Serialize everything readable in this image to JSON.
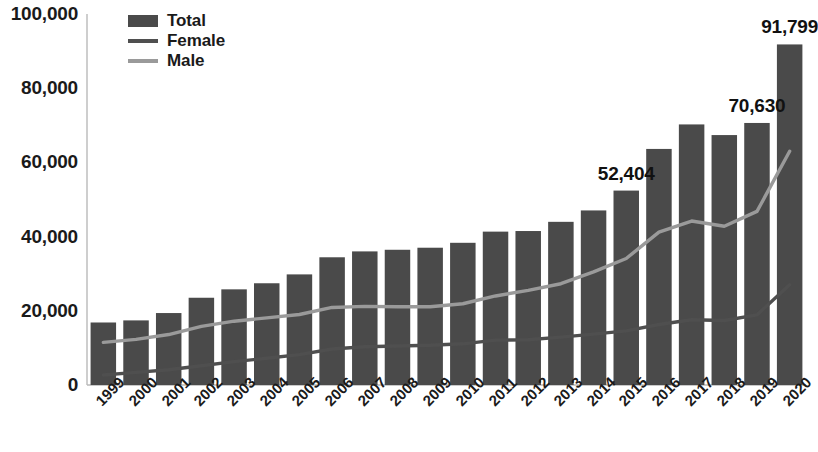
{
  "chart_data": {
    "type": "bar",
    "title": "",
    "subtitle": "",
    "xlabel": "",
    "ylabel": "",
    "ylim": [
      0,
      100000
    ],
    "yticks": [
      0,
      20000,
      40000,
      60000,
      80000,
      100000
    ],
    "ytick_labels": [
      "0",
      "20,000",
      "40,000",
      "60,000",
      "80,000",
      "100,000"
    ],
    "grid": false,
    "legend_position": "top-left",
    "categories": [
      "1999",
      "2000",
      "2001",
      "2002",
      "2003",
      "2004",
      "2005",
      "2006",
      "2007",
      "2008",
      "2009",
      "2010",
      "2011",
      "2012",
      "2013",
      "2014",
      "2015",
      "2016",
      "2017",
      "2018",
      "2019",
      "2020"
    ],
    "series": [
      {
        "name": "Total",
        "kind": "bar",
        "color": "#4a4a4a",
        "values": [
          16849,
          17415,
          19394,
          23518,
          25785,
          27424,
          29813,
          34426,
          36010,
          36450,
          37004,
          38329,
          41340,
          41502,
          43982,
          47055,
          52404,
          63632,
          70237,
          67367,
          70630,
          91799
        ]
      },
      {
        "name": "Female",
        "kind": "line",
        "color": "#4f4f4f",
        "values": [
          2700,
          3400,
          4100,
          5200,
          6300,
          7200,
          8200,
          9700,
          10300,
          10500,
          10700,
          11100,
          12100,
          12200,
          12900,
          13700,
          14600,
          16300,
          17600,
          17400,
          18900,
          27000
        ]
      },
      {
        "name": "Male",
        "kind": "line",
        "color": "#9a9a9a",
        "values": [
          11500,
          12300,
          13600,
          15800,
          17200,
          18100,
          19000,
          20900,
          21200,
          21100,
          21100,
          21900,
          24000,
          25500,
          27300,
          30500,
          34100,
          41200,
          44200,
          42800,
          46800,
          63000
        ]
      }
    ],
    "point_labels": [
      {
        "category": "2015",
        "value": 52404,
        "text": "52,404"
      },
      {
        "category": "2019",
        "value": 70630,
        "text": "70,630"
      },
      {
        "category": "2020",
        "value": 91799,
        "text": "91,799"
      }
    ]
  },
  "legend": {
    "items": [
      {
        "label": "Total",
        "marker": "bar-swatch",
        "color": "#4a4a4a"
      },
      {
        "label": "Female",
        "marker": "line-swatch",
        "color": "#4f4f4f"
      },
      {
        "label": "Male",
        "marker": "line-swatch",
        "color": "#9a9a9a"
      }
    ]
  },
  "axes": {
    "y_axis_line_color": "#b9b9b9",
    "x_axis_line_color": "#b9b9b9"
  }
}
